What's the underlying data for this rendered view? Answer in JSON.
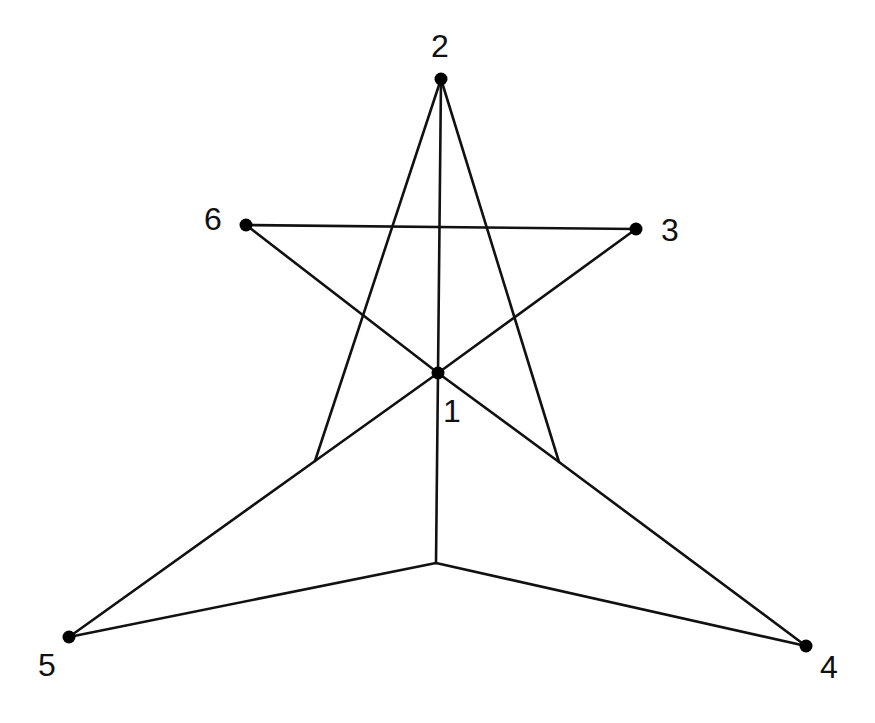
{
  "diagram": {
    "type": "graph",
    "colors": {
      "edge": "#111111",
      "node": "#000000",
      "label": "#111111",
      "background": "#ffffff"
    },
    "nodes": [
      {
        "id": "1",
        "label": "1",
        "x": 438,
        "y": 373,
        "label_x": 443,
        "label_y": 422
      },
      {
        "id": "2",
        "label": "2",
        "x": 441,
        "y": 79,
        "label_x": 431,
        "label_y": 57
      },
      {
        "id": "3",
        "label": "3",
        "x": 636,
        "y": 229,
        "label_x": 661,
        "label_y": 241
      },
      {
        "id": "4",
        "label": "4",
        "x": 806,
        "y": 646,
        "label_x": 820,
        "label_y": 678
      },
      {
        "id": "5",
        "label": "5",
        "x": 69,
        "y": 637,
        "label_x": 38,
        "label_y": 676
      },
      {
        "id": "6",
        "label": "6",
        "x": 246,
        "y": 225,
        "label_x": 204,
        "label_y": 230
      }
    ],
    "bend_points": [
      {
        "id": "bL",
        "x": 315,
        "y": 461
      },
      {
        "id": "bR",
        "x": 559,
        "y": 462
      },
      {
        "id": "bB",
        "x": 436,
        "y": 563
      }
    ],
    "edges": [
      {
        "from": "2",
        "to": "bB",
        "points": "441,79 438,373 436,563"
      },
      {
        "from": "6",
        "to": "3",
        "points": "246,225 636,229"
      },
      {
        "from": "6",
        "to": "4",
        "points": "246,225 438,373 559,462 806,646"
      },
      {
        "from": "3",
        "to": "5",
        "points": "636,229 438,373 315,461 69,637"
      },
      {
        "from": "2",
        "to": "bL",
        "points": "441,79 315,461"
      },
      {
        "from": "2",
        "to": "bR",
        "points": "441,79 559,462"
      },
      {
        "from": "bB",
        "to": "5",
        "points": "436,563 69,637"
      },
      {
        "from": "bB",
        "to": "4",
        "points": "436,563 806,646"
      }
    ]
  }
}
